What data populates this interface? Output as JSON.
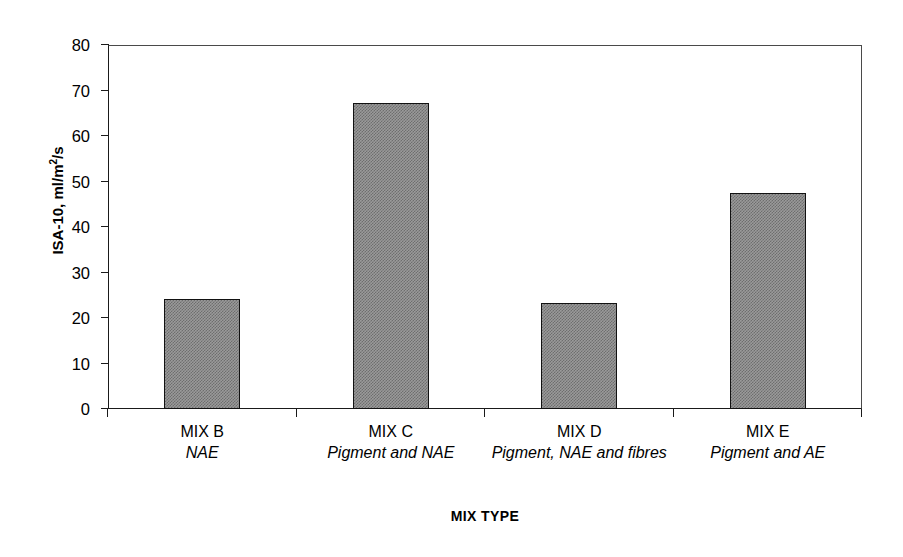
{
  "chart_data": {
    "type": "bar",
    "title": "",
    "categories": [
      "MIX B",
      "MIX C",
      "MIX D",
      "MIX E"
    ],
    "category_descriptions": [
      "NAE",
      "Pigment and NAE",
      "Pigment, NAE and fibres",
      "Pigment and AE"
    ],
    "values": [
      24.2,
      67.2,
      23.4,
      47.5
    ],
    "xlabel": "MIX TYPE",
    "ylabel": "ISA-10, ml/m2/s",
    "ylabel_parts": {
      "prefix": "ISA-10, ml/m",
      "superscript": "2",
      "suffix": "/s"
    },
    "ylim": [
      0,
      80
    ],
    "ytick_labels": [
      "80",
      "70",
      "60",
      "50",
      "40",
      "30",
      "20",
      "10",
      "0"
    ],
    "ytick_values": [
      80,
      70,
      60,
      50,
      40,
      30,
      20,
      10,
      0
    ],
    "grid": false,
    "legend": "none",
    "bar_fill_color": "#808080",
    "bar_edge_color": "#121212",
    "axis_color": "#1a1a1a",
    "background_color": "#ffffff"
  },
  "axis": {
    "x_title": "MIX TYPE"
  },
  "bars": [
    {
      "label": "MIX B",
      "description": "NAE",
      "value": 24.2
    },
    {
      "label": "MIX C",
      "description": "Pigment and NAE",
      "value": 67.2
    },
    {
      "label": "MIX D",
      "description": "Pigment, NAE and fibres",
      "value": 23.4
    },
    {
      "label": "MIX E",
      "description": "Pigment and AE",
      "value": 47.5
    }
  ],
  "y_ticks": [
    {
      "label": "80",
      "value": 80
    },
    {
      "label": "70",
      "value": 70
    },
    {
      "label": "60",
      "value": 60
    },
    {
      "label": "50",
      "value": 50
    },
    {
      "label": "40",
      "value": 40
    },
    {
      "label": "30",
      "value": 30
    },
    {
      "label": "20",
      "value": 20
    },
    {
      "label": "10",
      "value": 10
    },
    {
      "label": "0",
      "value": 0
    }
  ]
}
